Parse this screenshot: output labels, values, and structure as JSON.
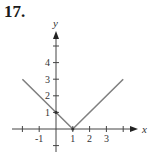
{
  "problem_number": "17.",
  "chart_data": {
    "type": "line",
    "title": "",
    "xlabel": "x",
    "ylabel": "y",
    "x_ticks": [
      -2,
      -1,
      1,
      2,
      3,
      4
    ],
    "x_tick_labels": [
      "-1",
      "1",
      "2",
      "3"
    ],
    "y_ticks": [
      -1,
      1,
      2,
      3,
      4,
      5
    ],
    "y_tick_labels": [
      "1",
      "2",
      "3",
      "4"
    ],
    "xlim": [
      -2.3,
      4.7
    ],
    "ylim": [
      -1.5,
      5.8
    ],
    "grid": false,
    "series": [
      {
        "name": "y = |x - 1|",
        "x": [
          -2,
          1,
          4
        ],
        "y": [
          3,
          0,
          3
        ],
        "color": "#808080"
      }
    ],
    "points": [
      {
        "x": 0,
        "y": 1
      },
      {
        "x": 1,
        "y": 0
      }
    ]
  }
}
